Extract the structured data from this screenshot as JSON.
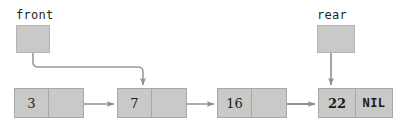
{
  "diagram": {
    "colors": {
      "node_fill": "#c9c9c7",
      "node_border": "#a8a8a6",
      "pointer_box_fill": "#c9c9c7",
      "pointer_box_border": "#b4b4b2",
      "arrow": "#8f8f8d",
      "text": "#1c1a19"
    },
    "pointers": [
      {
        "id": "front",
        "label": "front",
        "label_x": 16,
        "label_y": 8,
        "box_x": 16,
        "box_y": 25,
        "box_w": 34,
        "box_h": 28,
        "target_node": 1
      },
      {
        "id": "rear",
        "label": "rear",
        "label_x": 317,
        "label_y": 8,
        "box_x": 317,
        "box_y": 25,
        "box_w": 38,
        "box_h": 28,
        "target_node": 3
      }
    ],
    "nodes": [
      {
        "index": 0,
        "data": "3",
        "link": "",
        "x": 14,
        "y": 88,
        "tail": false
      },
      {
        "index": 1,
        "data": "7",
        "link": "",
        "x": 117,
        "y": 88,
        "tail": false
      },
      {
        "index": 2,
        "data": "16",
        "link": "",
        "x": 217,
        "y": 88,
        "tail": false
      },
      {
        "index": 3,
        "data": "22",
        "link": "NIL",
        "x": 318,
        "y": 88,
        "tail": true
      }
    ],
    "link_arrows": [
      {
        "from_node": 0,
        "to_node": 1,
        "x1": 82,
        "x2": 115,
        "y": 104
      },
      {
        "from_node": 1,
        "to_node": 2,
        "x1": 185,
        "x2": 215,
        "y": 104
      },
      {
        "from_node": 2,
        "to_node": 3,
        "x1": 285,
        "x2": 316,
        "y": 104
      }
    ],
    "pointer_arrows": [
      {
        "id": "front-to-head",
        "shape": "elbow",
        "start_x": 33,
        "start_y": 53,
        "mid_y": 67,
        "end_x": 143,
        "end_y": 86
      },
      {
        "id": "rear-to-tail",
        "shape": "straight",
        "start_x": 331,
        "start_y": 53,
        "end_x": 331,
        "end_y": 86
      }
    ]
  }
}
